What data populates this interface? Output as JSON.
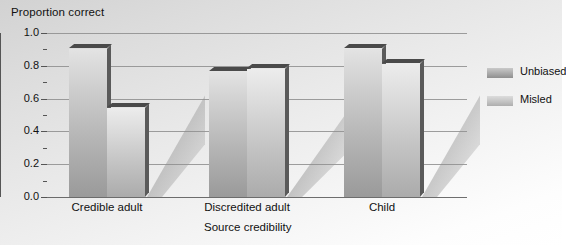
{
  "chart_data": {
    "type": "bar",
    "title": "",
    "ylabel": "Proportion correct",
    "xlabel": "Source credibility",
    "categories": [
      "Credible adult",
      "Discredited adult",
      "Child"
    ],
    "series": [
      {
        "name": "Unbiased",
        "values": [
          0.9,
          0.76,
          0.9
        ]
      },
      {
        "name": "Misled",
        "values": [
          0.54,
          0.78,
          0.81
        ]
      }
    ],
    "ylim": [
      0.0,
      1.0
    ],
    "ytick_labels": [
      "0.0",
      "0.2",
      "0.4",
      "0.6",
      "0.8",
      "1.0"
    ],
    "ytick_values": [
      0.0,
      0.2,
      0.4,
      0.6,
      0.8,
      1.0
    ],
    "minor_tick_values": [
      0.1,
      0.3,
      0.5,
      0.7,
      0.9
    ],
    "grid": true,
    "grid_axis": "y",
    "legend_position": "right",
    "style": "3d-bars-with-shadow",
    "colors": {
      "background": "#e8e8e8",
      "gridline": "#8d8d8d",
      "axis": "#555555",
      "unbiased_bar": "#b4b4b4",
      "misled_bar": "#c8c8c8",
      "bar_edge": "#4a4a4a",
      "text": "#111111"
    }
  }
}
